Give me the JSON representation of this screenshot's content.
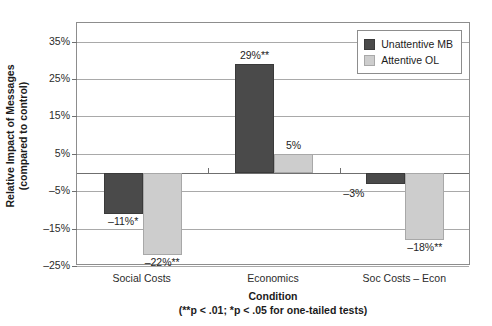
{
  "chart_data": {
    "type": "bar",
    "title": "",
    "xlabel": "Condition",
    "xlabel_note": "(**p < .01; *p < .05 for one-tailed tests)",
    "ylabel_line1": "Relative Impact of Messages",
    "ylabel_line2": "(compared to control)",
    "categories": [
      "Social Costs",
      "Economics",
      "Soc Costs – Econ"
    ],
    "series": [
      {
        "name": "Unattentive MB",
        "color": "#4a4a4a",
        "values": [
          -11,
          29,
          -3
        ],
        "labels": [
          "–11%*",
          "29%**",
          "–3%"
        ]
      },
      {
        "name": "Attentive OL",
        "color": "#cdcdcd",
        "values": [
          -22,
          5,
          -18
        ],
        "labels": [
          "–22%**",
          "5%",
          "–18%**"
        ]
      }
    ],
    "ylim": [
      -25,
      40
    ],
    "yticks": [
      35,
      25,
      15,
      5,
      -5,
      -15,
      -25
    ],
    "ytick_labels": [
      "35%",
      "25%",
      "15%",
      "5%",
      "–5%",
      "–15%",
      "–25%"
    ],
    "grid": true,
    "legend_position": "top-right"
  },
  "legend": {
    "items": [
      {
        "label": "Unattentive MB",
        "swatch": "dark"
      },
      {
        "label": "Attentive OL",
        "swatch": "light"
      }
    ]
  }
}
